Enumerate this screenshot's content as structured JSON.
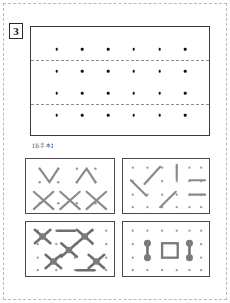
{
  "page": {
    "problem_number": "3",
    "frame_style": "dashed"
  },
  "card_section": {
    "label": "【カード】",
    "grid": {
      "columns": 6,
      "rows": 4,
      "dot_color": "#111111",
      "fold_lines_after_rows": [
        1,
        3
      ],
      "fold_line_style": "dashed",
      "fold_line_color": "#8d8d8d"
    },
    "border_color": "#3a3a3a"
  },
  "model_section": {
    "label": "【お手本】",
    "panels": [
      {
        "name": "panel-top-left",
        "position": "top-left",
        "dot_columns": 4,
        "dot_rows": 3,
        "shapes": [
          {
            "type": "v-shape",
            "label": "V"
          },
          {
            "type": "caret-shape",
            "label": "^"
          },
          {
            "type": "x-shape",
            "label": "X"
          },
          {
            "type": "x-shape",
            "label": "X"
          },
          {
            "type": "x-shape",
            "label": "X"
          }
        ],
        "stroke_color": "#8a8a8a"
      },
      {
        "name": "panel-top-right",
        "position": "top-right",
        "dot_columns": 6,
        "dot_rows": 4,
        "shapes": [
          {
            "type": "diagonal-up",
            "label": "/"
          },
          {
            "type": "diagonal-down",
            "label": "\\"
          },
          {
            "type": "vertical",
            "label": "|"
          },
          {
            "type": "horizontal",
            "label": "—"
          },
          {
            "type": "horizontal",
            "label": "—"
          },
          {
            "type": "diagonal-up",
            "label": "/"
          },
          {
            "type": "diagonal-down",
            "label": "\\"
          }
        ],
        "stroke_color": "#8a8a8a"
      },
      {
        "name": "panel-bottom-left",
        "position": "bottom-left",
        "dot_columns": 5,
        "dot_rows": 4,
        "shapes": [
          {
            "type": "x-node",
            "label": "X with center node"
          },
          {
            "type": "x-node",
            "label": "X with center node"
          },
          {
            "type": "x-node",
            "label": "X with center node"
          },
          {
            "type": "x-node",
            "label": "X with center node"
          },
          {
            "type": "x-node",
            "label": "X with center node"
          },
          {
            "type": "horizontal-bar",
            "label": "—"
          },
          {
            "type": "horizontal-bar",
            "label": "—"
          }
        ],
        "stroke_color": "#7b7b7b"
      },
      {
        "name": "panel-bottom-right",
        "position": "bottom-right",
        "dot_columns": 6,
        "dot_rows": 4,
        "shapes": [
          {
            "type": "vertical-dumbbell",
            "label": "I"
          },
          {
            "type": "square-outline",
            "label": "□"
          },
          {
            "type": "vertical-dumbbell",
            "label": "I"
          }
        ],
        "stroke_color": "#7b7b7b"
      }
    ]
  }
}
